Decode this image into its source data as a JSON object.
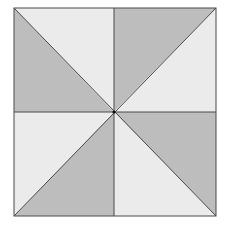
{
  "diagram": {
    "type": "pinwheel-square",
    "square": {
      "x1": 14,
      "y1": 8,
      "x2": 216,
      "y2": 216
    },
    "center": {
      "x": 114,
      "y": 112
    },
    "colors": {
      "background": "#ffffff",
      "light": "#ebebeb",
      "dark": "#bdbdbd",
      "line": "#4a4a4a",
      "center_dot": "#111111"
    },
    "triangles": [
      {
        "id": "top-left-upper",
        "shade": "light"
      },
      {
        "id": "top-right-upper",
        "shade": "dark"
      },
      {
        "id": "top-right-side",
        "shade": "light"
      },
      {
        "id": "bottom-right-side",
        "shade": "dark"
      },
      {
        "id": "bottom-right-lower",
        "shade": "light"
      },
      {
        "id": "bottom-left-lower",
        "shade": "dark"
      },
      {
        "id": "bottom-left-side",
        "shade": "light"
      },
      {
        "id": "top-left-side",
        "shade": "dark"
      }
    ]
  }
}
